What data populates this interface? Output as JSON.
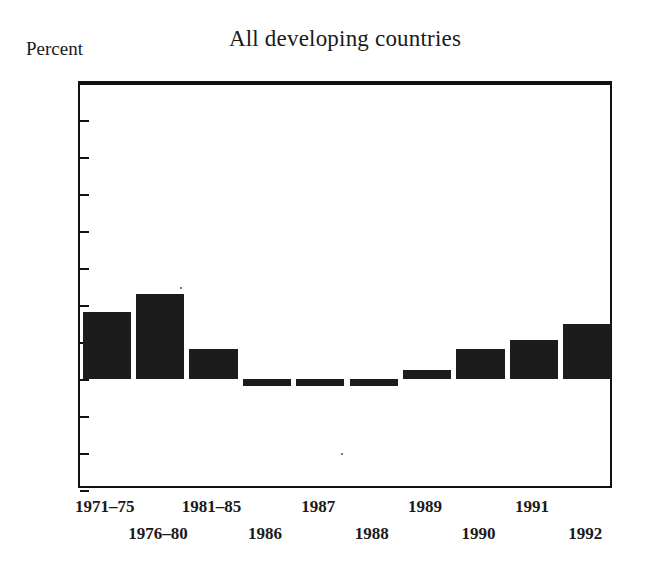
{
  "chart_data": {
    "type": "bar",
    "title": "All developing countries",
    "xlabel": "",
    "ylabel": "Percent",
    "ylim": [
      -3,
      8
    ],
    "ytick_labels": [
      "8",
      "7",
      "6",
      "5",
      "4",
      "3",
      "2",
      "1",
      "0",
      "−1",
      "−2",
      "−3"
    ],
    "yticks": [
      8,
      7,
      6,
      5,
      4,
      3,
      2,
      1,
      0,
      -1,
      -2,
      -3
    ],
    "grid": false,
    "legend": null,
    "categories": [
      "1971–75",
      "1976–80",
      "1981–85",
      "1986",
      "1987",
      "1988",
      "1989",
      "1990",
      "1991",
      "1992"
    ],
    "values": [
      1.8,
      2.3,
      0.8,
      -0.2,
      -0.2,
      -0.2,
      0.25,
      0.8,
      1.05,
      1.5
    ],
    "series": [
      {
        "name": "All developing countries",
        "values": [
          1.8,
          2.3,
          0.8,
          -0.2,
          -0.2,
          -0.2,
          0.25,
          0.8,
          1.05,
          1.5
        ]
      }
    ],
    "bar_color": "#1c1c1c",
    "axis_color": "#111111",
    "background_color": "#ffffff"
  }
}
